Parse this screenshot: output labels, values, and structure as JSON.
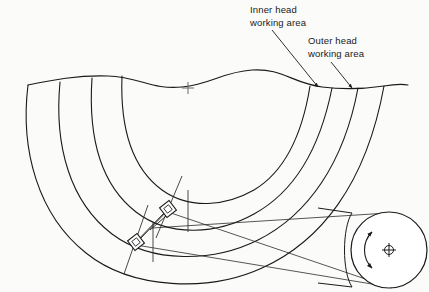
{
  "figure": {
    "type": "technical-line-drawing",
    "background_color": "#fbfbf9",
    "line_color": "#1a1a1a",
    "thin_line_color": "#3a3a3a"
  },
  "callouts": [
    {
      "id": "inner-head",
      "text": "Inner head\nworking area",
      "line_1": "Inner head",
      "line_2": "working area",
      "leader_from": [
        272,
        30
      ],
      "leader_to": [
        318,
        88
      ]
    },
    {
      "id": "outer-head",
      "text": "Outer head\nworking area",
      "line_1": "Outer head",
      "line_2": "working area",
      "leader_from": [
        330,
        62
      ],
      "leader_to": [
        352,
        89
      ]
    }
  ],
  "elements": {
    "break_line_label": "torn-edge break line",
    "arcs_count": 4,
    "heads": [
      {
        "id": "inner-head-block",
        "cx": 168,
        "cy": 209
      },
      {
        "id": "outer-head-block",
        "cx": 136,
        "cy": 242
      }
    ],
    "drum": {
      "id": "rotating-drum",
      "center_x": 389,
      "center_y": 250,
      "radius": 38,
      "rotation_marker": "curved-double-arrow",
      "axis_marker": "crosshair-circle"
    },
    "center_mark": {
      "cx": 188,
      "cy": 88,
      "symbol": "plus"
    }
  }
}
